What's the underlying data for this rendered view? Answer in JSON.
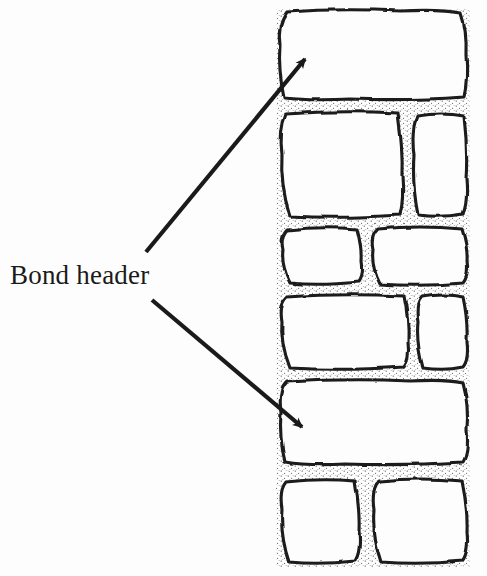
{
  "figure": {
    "type": "line-diagram",
    "background_color": "#fdfdfd",
    "ink_color": "#1a1a1a"
  },
  "annotations": {
    "label": "Bond header",
    "label_color": "#1a1a1a",
    "arrows": [
      {
        "name": "arrow-to-top-bond-header",
        "tail_x": 146,
        "tail_y": 252,
        "tip_x": 311,
        "tip_y": 52,
        "target": "top-course-header-brick"
      },
      {
        "name": "arrow-to-lower-bond-header",
        "tail_x": 152,
        "tail_y": 300,
        "tip_x": 310,
        "tip_y": 436,
        "target": "fifth-course-header-brick"
      }
    ]
  },
  "wall": {
    "left": 277,
    "right": 469,
    "top": 10,
    "bottom": 566,
    "mortar_color": "#ffffff",
    "stipple_color": "#2a2a2a",
    "courses": [
      {
        "name": "course-1-bond-header",
        "index": 1,
        "y_top": 11,
        "y_bottom": 100,
        "is_bond_header": true,
        "bricks": [
          {
            "name": "brick-header-top",
            "x_left": 279,
            "x_right": 468,
            "type": "header"
          }
        ]
      },
      {
        "name": "course-2-stretchers",
        "index": 2,
        "y_top": 111,
        "y_bottom": 218,
        "is_bond_header": false,
        "bricks": [
          {
            "name": "brick-2-left",
            "x_left": 279,
            "x_right": 403,
            "type": "stretcher"
          },
          {
            "name": "brick-2-right",
            "x_left": 413,
            "x_right": 468,
            "type": "stretcher"
          }
        ]
      },
      {
        "name": "course-3-stretchers",
        "index": 3,
        "y_top": 227,
        "y_bottom": 285,
        "is_bond_header": false,
        "bricks": [
          {
            "name": "brick-3-left",
            "x_left": 279,
            "x_right": 362,
            "type": "stretcher"
          },
          {
            "name": "brick-3-right",
            "x_left": 372,
            "x_right": 468,
            "type": "stretcher"
          }
        ]
      },
      {
        "name": "course-4-stretchers",
        "index": 4,
        "y_top": 294,
        "y_bottom": 369,
        "is_bond_header": false,
        "bricks": [
          {
            "name": "brick-4-left",
            "x_left": 279,
            "x_right": 409,
            "type": "stretcher"
          },
          {
            "name": "brick-4-right",
            "x_left": 418,
            "x_right": 468,
            "type": "stretcher"
          }
        ]
      },
      {
        "name": "course-5-bond-header",
        "index": 5,
        "y_top": 379,
        "y_bottom": 464,
        "is_bond_header": true,
        "bricks": [
          {
            "name": "brick-header-lower",
            "x_left": 279,
            "x_right": 468,
            "type": "header"
          }
        ]
      },
      {
        "name": "course-6-stretchers",
        "index": 6,
        "y_top": 478,
        "y_bottom": 563,
        "is_bond_header": false,
        "bricks": [
          {
            "name": "brick-6-left",
            "x_left": 279,
            "x_right": 360,
            "type": "stretcher"
          },
          {
            "name": "brick-6-right",
            "x_left": 373,
            "x_right": 468,
            "type": "stretcher"
          }
        ]
      }
    ]
  }
}
